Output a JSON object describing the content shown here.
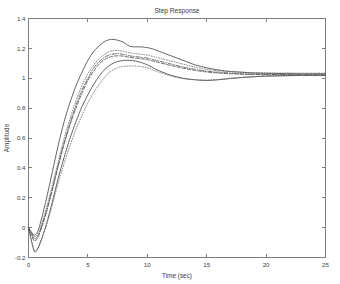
{
  "chart_data": {
    "type": "line",
    "title": "Step Response",
    "xlabel": "Time (sec)",
    "ylabel": "Amplitude",
    "xlim": [
      0,
      25
    ],
    "ylim": [
      -0.2,
      1.4
    ],
    "xticks": [
      0,
      5,
      10,
      15,
      20,
      25
    ],
    "yticks": [
      -0.2,
      0,
      0.2,
      0.4,
      0.6,
      0.8,
      1,
      1.2,
      1.4
    ],
    "xtick_labels": [
      "0",
      "5",
      "10",
      "15",
      "20",
      "25"
    ],
    "ytick_labels": [
      "-0.2",
      "0",
      "0.2",
      "0.4",
      "0.6",
      "0.8",
      "1",
      "1.2",
      "1.4"
    ],
    "grid": false,
    "legend": null,
    "legend_position": "none",
    "line_color": "#4a4a4a",
    "axis_color": "#7d7d7d",
    "background": "#ffffff",
    "x": [
      0,
      0.25,
      0.5,
      0.75,
      1,
      1.5,
      2,
      2.5,
      3,
      3.5,
      4,
      4.5,
      5,
      5.5,
      6,
      6.5,
      7,
      7.5,
      8,
      8.5,
      9,
      9.5,
      10,
      10.5,
      11,
      12,
      13,
      14,
      15,
      16,
      17,
      18,
      19,
      20,
      21,
      22,
      23,
      24,
      25
    ],
    "series": [
      {
        "name": "curve-1",
        "style": "solid",
        "peak": 1.26,
        "peak_time": 7.0,
        "undershoot": -0.05,
        "final_value": 1.03,
        "values": [
          0,
          -0.03,
          -0.05,
          -0.03,
          0.03,
          0.19,
          0.37,
          0.55,
          0.71,
          0.84,
          0.95,
          1.04,
          1.12,
          1.18,
          1.22,
          1.25,
          1.26,
          1.255,
          1.24,
          1.215,
          1.21,
          1.21,
          1.205,
          1.195,
          1.18,
          1.15,
          1.12,
          1.09,
          1.07,
          1.055,
          1.045,
          1.04,
          1.035,
          1.033,
          1.032,
          1.031,
          1.03,
          1.03,
          1.03
        ]
      },
      {
        "name": "curve-2",
        "style": "dotted",
        "peak": 1.185,
        "peak_time": 7.2,
        "undershoot": -0.06,
        "final_value": 1.035,
        "values": [
          0,
          -0.035,
          -0.06,
          -0.045,
          0.0,
          0.13,
          0.28,
          0.44,
          0.6,
          0.73,
          0.85,
          0.95,
          1.03,
          1.09,
          1.135,
          1.165,
          1.183,
          1.185,
          1.18,
          1.17,
          1.165,
          1.16,
          1.155,
          1.145,
          1.135,
          1.115,
          1.095,
          1.075,
          1.06,
          1.05,
          1.045,
          1.04,
          1.038,
          1.036,
          1.035,
          1.035,
          1.034,
          1.034,
          1.034
        ]
      },
      {
        "name": "curve-3",
        "style": "dashdot",
        "peak": 1.165,
        "peak_time": 7.3,
        "undershoot": -0.075,
        "final_value": 1.025,
        "values": [
          0,
          -0.04,
          -0.075,
          -0.06,
          -0.015,
          0.11,
          0.26,
          0.42,
          0.57,
          0.7,
          0.82,
          0.92,
          1.0,
          1.07,
          1.115,
          1.145,
          1.16,
          1.165,
          1.16,
          1.15,
          1.145,
          1.14,
          1.135,
          1.125,
          1.115,
          1.095,
          1.075,
          1.06,
          1.048,
          1.04,
          1.035,
          1.03,
          1.028,
          1.026,
          1.025,
          1.025,
          1.024,
          1.024,
          1.024
        ]
      },
      {
        "name": "curve-4",
        "style": "dashed",
        "peak": 1.15,
        "peak_time": 7.5,
        "undershoot": -0.09,
        "final_value": 1.022,
        "values": [
          0,
          -0.05,
          -0.09,
          -0.07,
          -0.025,
          0.1,
          0.25,
          0.41,
          0.56,
          0.69,
          0.8,
          0.9,
          0.985,
          1.05,
          1.1,
          1.13,
          1.145,
          1.15,
          1.148,
          1.14,
          1.135,
          1.13,
          1.125,
          1.115,
          1.105,
          1.085,
          1.068,
          1.053,
          1.042,
          1.035,
          1.03,
          1.027,
          1.025,
          1.023,
          1.022,
          1.022,
          1.021,
          1.021,
          1.021
        ]
      },
      {
        "name": "curve-5",
        "style": "solid",
        "peak": 1.12,
        "peak_time": 8.6,
        "undershoot": -0.16,
        "final_value": 1.02,
        "values": [
          0,
          -0.09,
          -0.16,
          -0.145,
          -0.1,
          0.02,
          0.17,
          0.33,
          0.47,
          0.6,
          0.71,
          0.81,
          0.89,
          0.96,
          1.02,
          1.065,
          1.095,
          1.112,
          1.119,
          1.12,
          1.115,
          1.105,
          1.09,
          1.07,
          1.05,
          1.02,
          1.0,
          0.99,
          0.985,
          0.99,
          0.998,
          1.005,
          1.01,
          1.014,
          1.016,
          1.018,
          1.019,
          1.02,
          1.02
        ]
      },
      {
        "name": "curve-6",
        "style": "dotted",
        "peak": 1.082,
        "peak_time": 9.0,
        "undershoot": -0.155,
        "final_value": 1.018,
        "values": [
          0,
          -0.085,
          -0.155,
          -0.14,
          -0.095,
          0.015,
          0.15,
          0.3,
          0.43,
          0.55,
          0.66,
          0.75,
          0.835,
          0.905,
          0.965,
          1.015,
          1.05,
          1.07,
          1.08,
          1.082,
          1.082,
          1.078,
          1.07,
          1.055,
          1.04,
          1.015,
          0.998,
          0.99,
          0.988,
          0.992,
          1.0,
          1.006,
          1.011,
          1.014,
          1.016,
          1.017,
          1.018,
          1.018,
          1.018
        ]
      }
    ]
  },
  "figure": {
    "title": "Step Response",
    "xlabel": "Time (sec)",
    "ylabel": "Amplitude"
  }
}
